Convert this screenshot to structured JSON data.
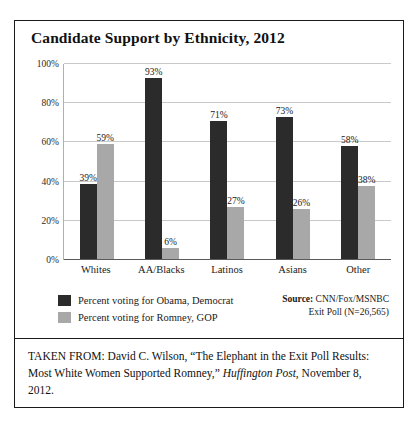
{
  "figure": {
    "title": "Candidate Support by Ethnicity, 2012",
    "source_label": "Source:",
    "source_line1": " CNN/Fox/MSNBC",
    "source_line2": "Exit Poll (N=26,565)",
    "caption_part1": "TAKEN FROM: David C. Wilson, “The Elephant in the Exit Poll Results: Most White Women Supported Romney,” ",
    "caption_italic": "Huffington Post",
    "caption_part2": ", November 8, 2012."
  },
  "colors": {
    "series_obama": "#2b2b2b",
    "series_romney": "#a8a8a8",
    "gridline": "#c9c9c9",
    "axis": "#5a5a5a",
    "border": "#1a1a1a",
    "text": "#111111",
    "background": "#ffffff"
  },
  "chart_data": {
    "type": "bar",
    "title": "Candidate Support by Ethnicity, 2012",
    "xlabel": "",
    "ylabel": "",
    "ylim": [
      0,
      100
    ],
    "yticks": [
      0,
      20,
      40,
      60,
      80,
      100
    ],
    "ytick_labels": [
      "0%",
      "20%",
      "40%",
      "60%",
      "80%",
      "100%"
    ],
    "grid": true,
    "legend_position": "below-left",
    "categories": [
      "Whites",
      "AA/Blacks",
      "Latinos",
      "Asians",
      "Other"
    ],
    "series": [
      {
        "name": "Percent voting for Obama, Democrat",
        "color": "#2b2b2b",
        "values": [
          39,
          93,
          71,
          73,
          58
        ],
        "labels": [
          "39%",
          "93%",
          "71%",
          "73%",
          "58%"
        ]
      },
      {
        "name": "Percent voting for Romney, GOP",
        "color": "#a8a8a8",
        "values": [
          59,
          6,
          27,
          26,
          38
        ],
        "labels": [
          "59%",
          "6%",
          "27%",
          "26%",
          "38%"
        ]
      }
    ]
  }
}
